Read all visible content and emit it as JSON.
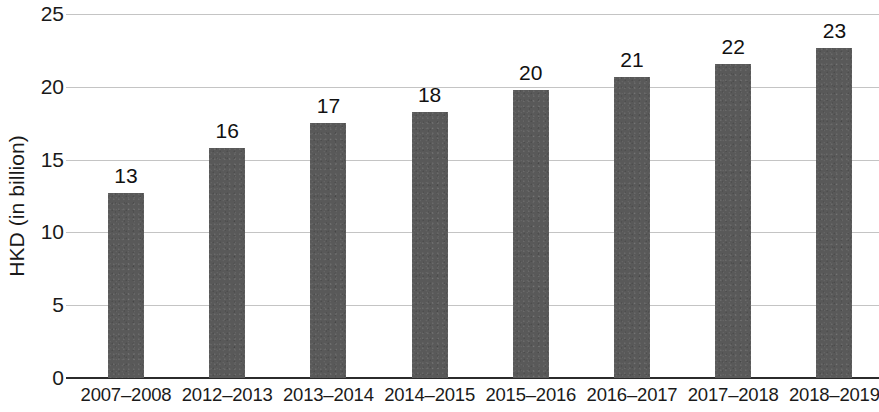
{
  "chart_data": {
    "type": "bar",
    "title": "",
    "subtitle": "",
    "xlabel": "",
    "ylabel": "HKD (in billion)",
    "categories": [
      "2007–2008",
      "2012–2013",
      "2013–2014",
      "2014–2015",
      "2015–2016",
      "2016–2017",
      "2017–2018",
      "2018–2019"
    ],
    "values": [
      12.7,
      15.8,
      17.5,
      18.3,
      19.8,
      20.7,
      21.6,
      22.7
    ],
    "data_labels": [
      "13",
      "16",
      "17",
      "18",
      "20",
      "21",
      "22",
      "23"
    ],
    "ylim": [
      0,
      25
    ],
    "y_ticks": [
      "0",
      "5",
      "10",
      "15",
      "20",
      "25"
    ],
    "y_tick_values": [
      0,
      5,
      10,
      15,
      20,
      25
    ],
    "grid": true,
    "legend": null,
    "legend_position": "none",
    "series": [
      {
        "name": "HKD (in billion)",
        "values": [
          12.7,
          15.8,
          17.5,
          18.3,
          19.8,
          20.7,
          21.6,
          22.7
        ],
        "color": "#595959"
      }
    ]
  },
  "colors": {
    "bar": "#595959",
    "gridline": "#c4c4c4",
    "axis": "#2b2b2b",
    "text": "#1a1a1a",
    "background": "#ffffff"
  }
}
